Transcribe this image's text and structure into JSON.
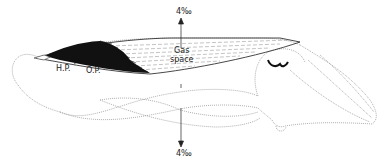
{
  "diagram": {
    "labels": {
      "top_arrow": "4‰",
      "bottom_arrow": "4‰",
      "gas_line1": "Gas",
      "gas_line2": "space",
      "hp": "H.P.",
      "op": "O.P."
    },
    "colors": {
      "outline": "#9a9a9a",
      "ink": "#111111",
      "background": "#ffffff"
    }
  }
}
